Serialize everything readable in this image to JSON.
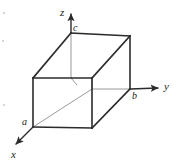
{
  "figure": {
    "width": 180,
    "height": 165,
    "background_color": "#ffffff",
    "line_color": "#2b2b2b",
    "hidden_line_color": "#9a9a9a",
    "label_color": "#1a1a1a"
  },
  "axes": [
    {
      "id": "z",
      "label": "z",
      "direction": "up",
      "from": [
        92,
        89
      ],
      "to": [
        71,
        13
      ],
      "arrow": true
    },
    {
      "id": "y",
      "label": "y",
      "direction": "right",
      "from": [
        92,
        89
      ],
      "to": [
        160,
        88
      ],
      "arrow": true
    },
    {
      "id": "x",
      "label": "x",
      "direction": "down-left",
      "from": [
        92,
        89
      ],
      "to": [
        12,
        148
      ],
      "arrow": true
    }
  ],
  "axis_labels": [
    {
      "id": "z",
      "text": "z",
      "x": 60,
      "y": 8
    },
    {
      "id": "y",
      "text": "y",
      "x": 165,
      "y": 82
    },
    {
      "id": "x",
      "text": "x",
      "x": 11,
      "y": 150
    }
  ],
  "vertex_labels": [
    {
      "id": "c",
      "text": "c",
      "x": 73,
      "y": 24,
      "axis": "z"
    },
    {
      "id": "b",
      "text": "b",
      "x": 133,
      "y": 92,
      "axis": "y"
    },
    {
      "id": "a",
      "text": "a",
      "x": 22,
      "y": 118,
      "axis": "x"
    }
  ],
  "cube": {
    "comment": "Parallelepiped unit cell drawn in oblique projection; vertices in screen pixel coordinates",
    "vertices": {
      "origin_back_bottom": [
        92,
        89
      ],
      "top_back_left_c": [
        71,
        33
      ],
      "top_back_right": [
        130,
        36
      ],
      "top_front_left": [
        33,
        78
      ],
      "top_front_right": [
        92,
        78
      ],
      "bottom_front_left_a": [
        33,
        127
      ],
      "bottom_front_right": [
        92,
        128
      ],
      "bottom_back_right_b": [
        130,
        89
      ]
    },
    "solid_edges": [
      [
        [
          71,
          33
        ],
        [
          130,
          36
        ]
      ],
      [
        [
          71,
          33
        ],
        [
          33,
          78
        ]
      ],
      [
        [
          130,
          36
        ],
        [
          92,
          78
        ]
      ],
      [
        [
          130,
          36
        ],
        [
          130,
          89
        ]
      ],
      [
        [
          33,
          78
        ],
        [
          92,
          78
        ]
      ],
      [
        [
          33,
          78
        ],
        [
          33,
          127
        ]
      ],
      [
        [
          33,
          127
        ],
        [
          92,
          128
        ]
      ],
      [
        [
          92,
          128
        ],
        [
          92,
          78
        ]
      ],
      [
        [
          92,
          128
        ],
        [
          130,
          89
        ]
      ],
      [
        [
          71,
          33
        ],
        [
          71,
          50
        ]
      ]
    ],
    "hidden_edges": [
      [
        [
          92,
          78
        ],
        [
          92,
          89
        ]
      ],
      [
        [
          92,
          89
        ],
        [
          130,
          89
        ]
      ],
      [
        [
          33,
          127
        ],
        [
          92,
          89
        ]
      ],
      [
        [
          71,
          50
        ],
        [
          71,
          78
        ]
      ],
      [
        [
          71,
          78
        ],
        [
          71,
          89
        ]
      ]
    ]
  }
}
